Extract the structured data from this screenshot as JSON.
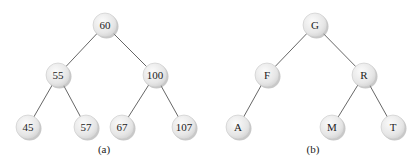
{
  "figures": [
    {
      "caption": "(a)",
      "nodes": [
        {
          "label": "60",
          "x": 105,
          "y": 25
        },
        {
          "label": "55",
          "x": 58,
          "y": 75
        },
        {
          "label": "100",
          "x": 155,
          "y": 75
        },
        {
          "label": "45",
          "x": 28,
          "y": 127
        },
        {
          "label": "57",
          "x": 86,
          "y": 127
        },
        {
          "label": "67",
          "x": 122,
          "y": 127
        },
        {
          "label": "107",
          "x": 184,
          "y": 127
        }
      ],
      "edges": [
        [
          0,
          1
        ],
        [
          0,
          2
        ],
        [
          1,
          3
        ],
        [
          1,
          4
        ],
        [
          2,
          5
        ],
        [
          2,
          6
        ]
      ],
      "caption_pos": {
        "x": 104,
        "y": 149
      }
    },
    {
      "caption": "(b)",
      "nodes": [
        {
          "label": "G",
          "x": 315,
          "y": 25
        },
        {
          "label": "F",
          "x": 267,
          "y": 75
        },
        {
          "label": "R",
          "x": 364,
          "y": 75
        },
        {
          "label": "A",
          "x": 238,
          "y": 127
        },
        {
          "label": "M",
          "x": 332,
          "y": 127
        },
        {
          "label": "T",
          "x": 393,
          "y": 127
        }
      ],
      "edges": [
        [
          0,
          1
        ],
        [
          0,
          2
        ],
        [
          1,
          3
        ],
        [
          2,
          4
        ],
        [
          2,
          5
        ]
      ],
      "caption_pos": {
        "x": 313,
        "y": 149
      }
    }
  ],
  "style": {
    "node_radius": 12
  }
}
